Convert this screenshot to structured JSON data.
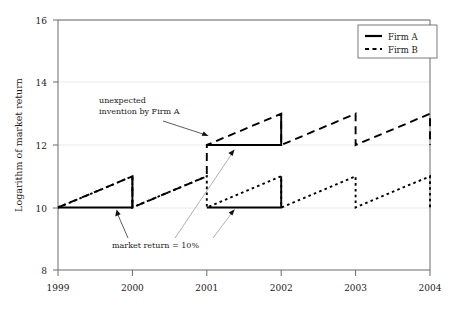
{
  "chart_data": {
    "type": "line",
    "title": "",
    "subtitle": "",
    "xlabel": "",
    "ylabel": "Logarithm of market return",
    "xlim": [
      1999,
      2004
    ],
    "ylim": [
      8,
      16
    ],
    "x_tick_labels": [
      "1999",
      "2000",
      "2001",
      "2002",
      "2003",
      "2004"
    ],
    "x_ticks": [
      1999,
      2000,
      2001,
      2002,
      2003,
      2004
    ],
    "y_tick_labels": [
      "8",
      "10",
      "12",
      "14",
      "16"
    ],
    "y_ticks": [
      8,
      10,
      12,
      14,
      16
    ],
    "grid": true,
    "grid_axis": "y",
    "legend_position": "top-right",
    "legend": [
      {
        "name": "Firm A",
        "style": "solid",
        "label": "Firm A"
      },
      {
        "name": "Firm B",
        "style": "dotted",
        "label": "Firm B"
      }
    ],
    "series": [
      {
        "name": "Firm A",
        "style": "dashed",
        "comment": "sawtooth: rises 1 log unit per year then resets; jumps to level 12 at 2001",
        "points": [
          {
            "x": 1999.0,
            "y": 10.0
          },
          {
            "x": 2000.0,
            "y": 11.0
          },
          {
            "x": 2000.0,
            "y": 10.0
          },
          {
            "x": 2001.0,
            "y": 11.0
          },
          {
            "x": 2001.0,
            "y": 12.0
          },
          {
            "x": 2002.0,
            "y": 13.0
          },
          {
            "x": 2002.0,
            "y": 12.0
          },
          {
            "x": 2003.0,
            "y": 13.0
          },
          {
            "x": 2003.0,
            "y": 12.0
          },
          {
            "x": 2004.0,
            "y": 13.0
          },
          {
            "x": 2004.0,
            "y": 12.0
          }
        ]
      },
      {
        "name": "Firm B",
        "style": "dotted",
        "comment": "identical to Firm A until 2001, thereafter resets to level 10 sawtooth",
        "points": [
          {
            "x": 1999.0,
            "y": 10.0
          },
          {
            "x": 2000.0,
            "y": 11.0
          },
          {
            "x": 2000.0,
            "y": 10.0
          },
          {
            "x": 2001.0,
            "y": 11.0
          },
          {
            "x": 2001.0,
            "y": 10.0
          },
          {
            "x": 2002.0,
            "y": 11.0
          },
          {
            "x": 2002.0,
            "y": 10.0
          },
          {
            "x": 2003.0,
            "y": 11.0
          },
          {
            "x": 2003.0,
            "y": 10.0
          },
          {
            "x": 2004.0,
            "y": 11.0
          },
          {
            "x": 2004.0,
            "y": 10.0
          }
        ]
      },
      {
        "name": "Reference level Firm A 1999-2000",
        "style": "solid",
        "points": [
          {
            "x": 1999.0,
            "y": 10.0
          },
          {
            "x": 2000.0,
            "y": 10.0
          },
          {
            "x": 2000.0,
            "y": 11.0
          }
        ]
      },
      {
        "name": "Reference level Firm A 2001-2002",
        "style": "solid",
        "points": [
          {
            "x": 2001.0,
            "y": 12.0
          },
          {
            "x": 2002.0,
            "y": 12.0
          },
          {
            "x": 2002.0,
            "y": 13.0
          }
        ]
      },
      {
        "name": "Reference level Firm B 2001-2002",
        "style": "solid",
        "points": [
          {
            "x": 2001.0,
            "y": 10.0
          },
          {
            "x": 2002.0,
            "y": 10.0
          },
          {
            "x": 2002.0,
            "y": 11.0
          }
        ]
      }
    ],
    "annotations": [
      {
        "id": "invention",
        "lines": [
          "unexpected",
          "invention by Firm A"
        ],
        "text": "unexpected invention by Firm A",
        "text_x": 1999.55,
        "text_y": 13.05,
        "arrows": [
          {
            "to_x": 2001.02,
            "to_y": 12.08
          }
        ]
      },
      {
        "id": "market-return",
        "lines": [
          "market return = 10%"
        ],
        "text": "market return = 10%",
        "text_x": 1999.75,
        "text_y": 9.05,
        "arrows": [
          {
            "to_x": 1999.8,
            "to_y": 10.02
          },
          {
            "to_x": 2001.38,
            "to_y": 12.02
          },
          {
            "to_x": 2001.38,
            "to_y": 10.02
          }
        ]
      }
    ],
    "colors": {
      "line": "#000000",
      "axis": "#555555",
      "grid": "#e8e8e8",
      "text": "#1a1a1a",
      "background": "#ffffff",
      "annotation_leader": "#999999"
    }
  },
  "figure": {
    "ylabel": "Logarithm of market return",
    "legend_title": ""
  }
}
